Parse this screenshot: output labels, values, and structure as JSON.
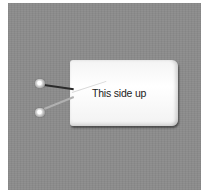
{
  "image": {
    "description": "Grayscale photo of a small white rectangular package with two wires ending in round metal connectors, on a gray background",
    "colors": {
      "background": "#8c8c8c",
      "package": "#f6f6f6",
      "text": "#222222",
      "border": "#ffffff"
    }
  },
  "package": {
    "label": "This side up"
  }
}
